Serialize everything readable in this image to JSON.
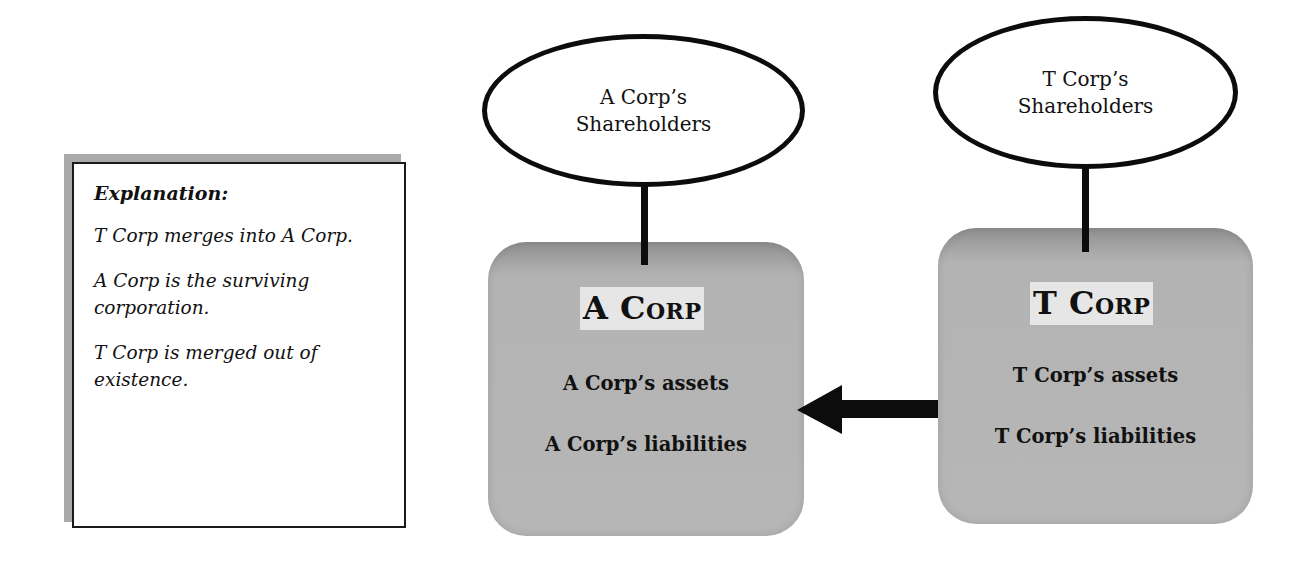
{
  "explanation": {
    "title": "Explanation:",
    "paragraphs": [
      "T Corp merges into A Corp.",
      "A Corp is the surviving corporation.",
      "T Corp is merged out of existence."
    ]
  },
  "shareholders": {
    "a": "A Corp’s Shareholders",
    "t": "T Corp’s Shareholders"
  },
  "corps": {
    "a": {
      "title": "A Corp",
      "assets": "A Corp’s assets",
      "liabilities": "A Corp’s liabilities"
    },
    "t": {
      "title": "T Corp",
      "assets": "T Corp’s assets",
      "liabilities": "T Corp’s liabilities"
    }
  },
  "arrow": {
    "direction": "left",
    "from": "T Corp",
    "to": "A Corp",
    "icon": "arrow-left-icon"
  },
  "colors": {
    "box_fill": "#b6b6b6",
    "box_top": "#8f8f8f",
    "title_bg": "#e6e6e6",
    "stroke": "#0c0c0c",
    "shadow": "#a9a9a9"
  }
}
